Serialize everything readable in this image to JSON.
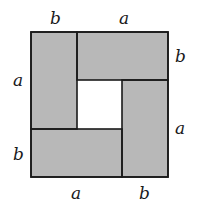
{
  "diagram": {
    "colors": {
      "fill": "#b8b8b8",
      "stroke": "#1a1a1a",
      "background": "#ffffff",
      "hole": "#ffffff"
    },
    "labels": {
      "top_left": "b",
      "top_right": "a",
      "right_top": "b",
      "right_bottom": "a",
      "left_top": "a",
      "left_bottom": "b",
      "bottom_left": "a",
      "bottom_right": "b"
    }
  }
}
